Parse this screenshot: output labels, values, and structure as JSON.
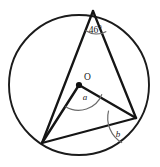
{
  "figure": {
    "type": "circle-geometry-diagram",
    "background_color": "#ffffff",
    "stroke_color": "#151515",
    "arc_color": "#6b6b6b",
    "labels": {
      "center_label": "O",
      "central_angle_label": "a",
      "inscribed_angle_label": "b",
      "apex_angle_label": "46°"
    },
    "geometry": {
      "circle": {
        "cx": 79,
        "cy": 85,
        "r": 70
      },
      "points": {
        "apex": {
          "name": "A",
          "x": 93,
          "y": 11
        },
        "bottom_left": {
          "name": "B",
          "x": 42,
          "y": 143
        },
        "right": {
          "name": "C",
          "x": 136,
          "y": 118
        },
        "center": {
          "name": "O",
          "x": 79,
          "y": 85
        }
      },
      "segments": [
        {
          "name": "chord-apex-to-bottom-left",
          "from": "apex",
          "to": "bottom_left"
        },
        {
          "name": "chord-apex-to-right",
          "from": "apex",
          "to": "right"
        },
        {
          "name": "chord-bottom-left-to-right",
          "from": "bottom_left",
          "to": "right"
        },
        {
          "name": "radius-center-to-bottom-left",
          "from": "center",
          "to": "bottom_left"
        },
        {
          "name": "radius-center-to-right",
          "from": "center",
          "to": "right"
        }
      ],
      "angle_markers": [
        {
          "name": "apex-angle-46",
          "vertex": "apex",
          "value": "46°"
        },
        {
          "name": "central-angle-a",
          "vertex": "center",
          "value": "a"
        },
        {
          "name": "inscribed-angle-b",
          "vertex": "right",
          "value": "b"
        }
      ]
    }
  }
}
